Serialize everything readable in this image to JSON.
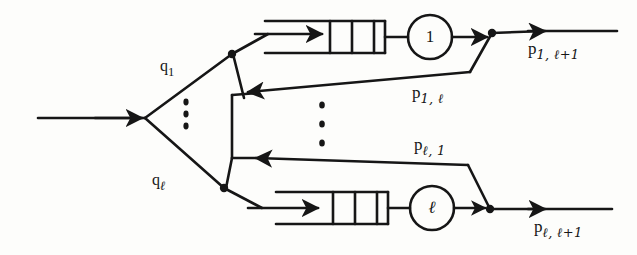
{
  "figure": {
    "type": "queueing-network-diagram",
    "ink_color": "#161616",
    "paper_color": "#fdfdfb"
  },
  "labels": {
    "arrival_branch_top": {
      "base": "q",
      "sub": "1"
    },
    "arrival_branch_bottom": {
      "base": "q",
      "sub": "ℓ"
    },
    "departure_top": {
      "base": "p",
      "sub": "1, ℓ+1"
    },
    "departure_bottom": {
      "base": "p",
      "sub": "ℓ, ℓ+1"
    },
    "feedback_top": {
      "base": "p",
      "sub": "1, ℓ"
    },
    "feedback_bottom": {
      "base": "p",
      "sub": "ℓ, 1"
    }
  },
  "servers": [
    {
      "name": "server-1",
      "label": "1"
    },
    {
      "name": "server-l",
      "label": "ℓ"
    }
  ],
  "stations": [
    {
      "name": "station-top",
      "queue_slots": 3,
      "server_label": "1",
      "inflow_label": "q1",
      "outflow_label": "p1,l+1",
      "feedback_label": "p1,l"
    },
    {
      "name": "station-bottom",
      "queue_slots": 3,
      "server_label": "ℓ",
      "inflow_label": "ql",
      "outflow_label": "pl,l+1",
      "feedback_label": "pl,1"
    }
  ],
  "ellipses": [
    {
      "name": "fork-ellipsis",
      "dots": 3
    },
    {
      "name": "center-ellipsis",
      "dots": 3
    }
  ]
}
